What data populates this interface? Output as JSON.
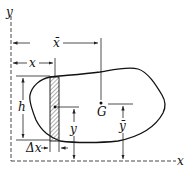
{
  "diagram": {
    "axes": {
      "x_label": "x",
      "y_label": "y"
    },
    "labels": {
      "x_bar": "x̄",
      "x_strip": "x",
      "h": "h",
      "y_strip": "y",
      "y_bar": "ȳ",
      "delta_x": "Δx",
      "centroid": "G"
    },
    "colors": {
      "line": "#111111",
      "background": "#ffffff"
    }
  }
}
